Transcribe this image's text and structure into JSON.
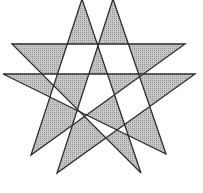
{
  "figure": {
    "width": 203,
    "height": 193,
    "background_color": "#ffffff",
    "shade_color": "#c6c6c6",
    "shade_dot_color": "#9a9a9a",
    "stroke_color": "#2e2e2e",
    "stroke_width": 1.3,
    "fill_rule": "evenodd",
    "stars": [
      {
        "name": "star-left",
        "vertices": {
          "top": [
            82,
            -1
          ],
          "upper_left": [
            12,
            44
          ],
          "upper_right": [
            185,
            44
          ],
          "bottom_left": [
            31,
            155
          ],
          "bottom_right": [
            141,
            173
          ]
        }
      },
      {
        "name": "star-right",
        "vertices": {
          "top": [
            113,
            -1
          ],
          "upper_left": [
            3,
            74
          ],
          "upper_right": [
            195,
            74
          ],
          "bottom_left": [
            57,
            173
          ],
          "bottom_right": [
            166,
            154
          ]
        }
      }
    ]
  }
}
